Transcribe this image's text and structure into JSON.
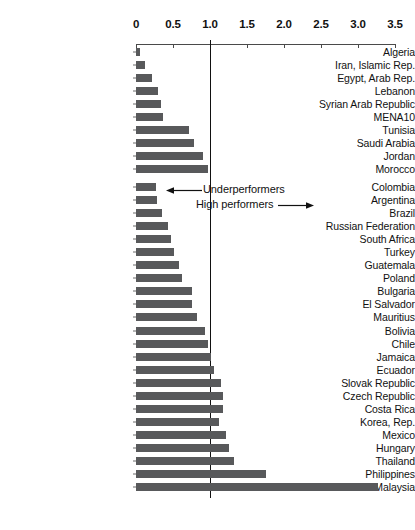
{
  "chart_data": {
    "type": "bar",
    "orientation": "horizontal",
    "title": "",
    "subtitle": "",
    "xlabel": "",
    "ylabel": "",
    "xlim": [
      0,
      3.5
    ],
    "xticks": [
      "0",
      "0.5",
      "1.0",
      "1.5",
      "2.0",
      "2.5",
      "3.0",
      "3.5"
    ],
    "xtick_values": [
      0,
      0.5,
      1.0,
      1.5,
      2.0,
      2.5,
      3.0,
      3.5
    ],
    "grid": false,
    "legend": "none",
    "reference_line": 1.0,
    "bar_color": "#58595b",
    "categories": [
      "Algeria",
      "Iran, Islamic Rep.",
      "Egypt, Arab Rep.",
      "Lebanon",
      "Syrian Arab Republic",
      "MENA10",
      "Tunisia",
      "Saudi Arabia",
      "Jordan",
      "Morocco",
      "Colombia",
      "Argentina",
      "Brazil",
      "Russian Federation",
      "South Africa",
      "Turkey",
      "Guatemala",
      "Poland",
      "Bulgaria",
      "El Salvador",
      "Mauritius",
      "Bolivia",
      "Chile",
      "Jamaica",
      "Ecuador",
      "Slovak Republic",
      "Czech Republic",
      "Costa Rica",
      "Korea, Rep.",
      "Mexico",
      "Hungary",
      "Thailand",
      "Philippines",
      "Malaysia"
    ],
    "values": [
      0.05,
      0.12,
      0.22,
      0.3,
      0.34,
      0.36,
      0.72,
      0.79,
      0.91,
      0.97,
      0.27,
      0.29,
      0.35,
      0.43,
      0.47,
      0.51,
      0.58,
      0.62,
      0.75,
      0.76,
      0.82,
      0.93,
      0.97,
      1.02,
      1.05,
      1.15,
      1.18,
      1.18,
      1.12,
      1.21,
      1.25,
      1.32,
      1.75,
      3.27
    ],
    "group_break_after_index": 9,
    "annotations": [
      {
        "text": "Underperformers",
        "arrow": "left",
        "x_value": 0.45,
        "category": "Colombia"
      },
      {
        "text": "High performers",
        "arrow": "right",
        "x_value": 1.5,
        "category": "Argentina"
      }
    ]
  }
}
